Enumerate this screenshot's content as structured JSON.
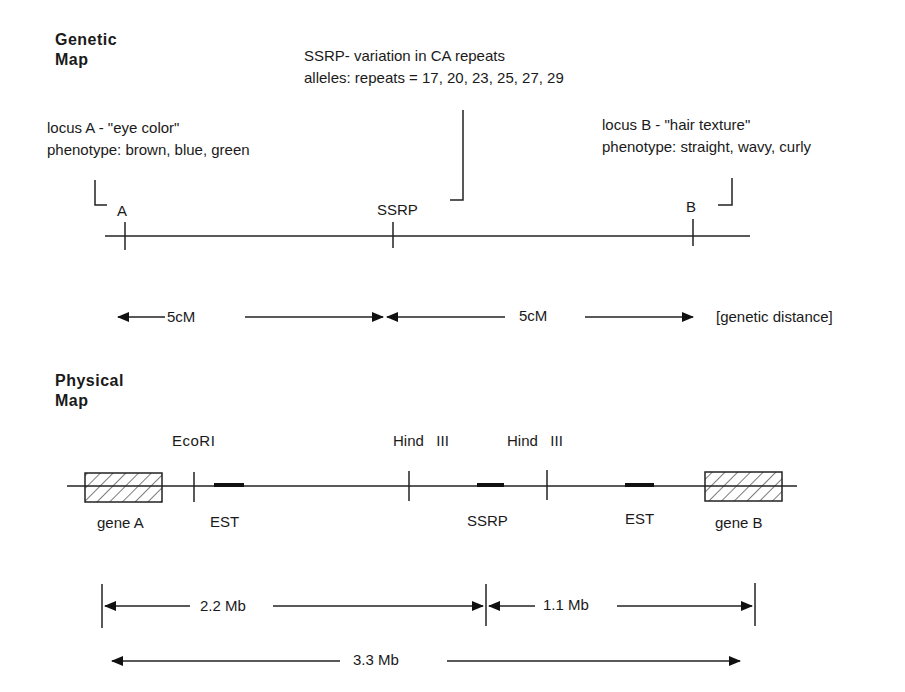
{
  "genetic_map": {
    "title_line1": "Genetic",
    "title_line2": "Map",
    "ssrp_note": {
      "line1": "SSRP- variation in CA repeats",
      "line2": "alleles: repeats = 17, 20, 23, 25, 27, 29"
    },
    "locus_a_note": {
      "line1": "locus A - \"eye color\"",
      "line2": "phenotype: brown, blue, green"
    },
    "locus_b_note": {
      "line1": "locus B - \"hair texture\"",
      "line2": "phenotype: straight, wavy, curly"
    },
    "markers": [
      {
        "label": "A"
      },
      {
        "label": "SSRP"
      },
      {
        "label": "B"
      }
    ],
    "distances": [
      {
        "label": "5cM"
      },
      {
        "label": "5cM"
      }
    ],
    "distance_caption": "[genetic distance]"
  },
  "physical_map": {
    "title_line1": "Physical",
    "title_line2": "Map",
    "sites": [
      {
        "label": "EcoRI"
      },
      {
        "label": "Hind   III"
      },
      {
        "label": "Hind   III"
      }
    ],
    "features": [
      {
        "label": "gene A"
      },
      {
        "label": "EST"
      },
      {
        "label": "SSRP"
      },
      {
        "label": "EST"
      },
      {
        "label": "gene B"
      }
    ],
    "distances": [
      {
        "label": "2.2 Mb"
      },
      {
        "label": "1.1 Mb"
      },
      {
        "label": "3.3 Mb"
      }
    ]
  }
}
